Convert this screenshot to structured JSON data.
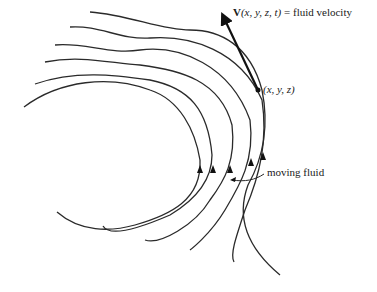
{
  "figure": {
    "type": "streamline-diagram",
    "colors": {
      "line": "#2a2a2a",
      "vector": "#111111",
      "background": "#ffffff"
    },
    "labels": {
      "velocity_symbol": "V",
      "velocity_args": "(x, y, z, t)",
      "velocity_equals": " = fluid velocity",
      "point": "(x, y, z)",
      "moving_fluid": "moving fluid"
    },
    "streamline_count": 6,
    "point_marker": "filled-dot"
  }
}
